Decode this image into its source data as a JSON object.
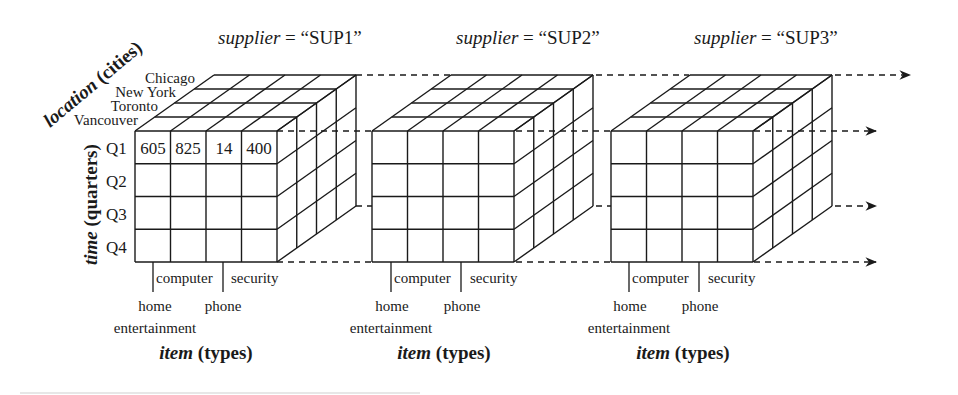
{
  "diagram": {
    "type": "data-cube",
    "dimensions": {
      "time": {
        "label_italic": "time",
        "label_rest": " (quarters)",
        "values": [
          "Q1",
          "Q2",
          "Q3",
          "Q4"
        ]
      },
      "item": {
        "label_italic": "item",
        "label_rest": " (types)",
        "values": [
          "home entertainment",
          "computer",
          "phone",
          "security"
        ],
        "tick_labels": {
          "home": "home",
          "entertainment": "entertainment",
          "computer": "computer",
          "phone": "phone",
          "security": "security"
        }
      },
      "location": {
        "label_italic": "location",
        "label_rest": " (cities)",
        "values": [
          "Chicago",
          "New York",
          "Toronto",
          "Vancouver"
        ]
      },
      "supplier": {
        "label": "supplier",
        "values": [
          "SUP1",
          "SUP2",
          "SUP3"
        ]
      }
    },
    "cubes": [
      {
        "title_italic": "supplier",
        "title_rest": " = “SUP1”",
        "q1_vancouver_values": [
          "605",
          "825",
          "14",
          "400"
        ]
      },
      {
        "title_italic": "supplier",
        "title_rest": " = “SUP2”"
      },
      {
        "title_italic": "supplier",
        "title_rest": " = “SUP3”"
      }
    ],
    "colors": {
      "line": "#1a1a1a",
      "background": "#ffffff"
    }
  }
}
